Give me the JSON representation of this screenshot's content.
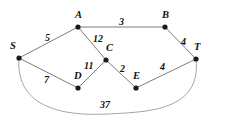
{
  "diagram": {
    "type": "weighted-undirected-graph",
    "nodes": [
      {
        "id": "S",
        "label": "S",
        "x": 19,
        "y": 58,
        "label_dx": -9,
        "label_dy": -17
      },
      {
        "id": "A",
        "label": "A",
        "x": 78,
        "y": 27,
        "label_dx": -3,
        "label_dy": -17
      },
      {
        "id": "B",
        "label": "B",
        "x": 165,
        "y": 27,
        "label_dx": -3,
        "label_dy": -17
      },
      {
        "id": "C",
        "label": "C",
        "x": 106,
        "y": 60,
        "label_dx": 0,
        "label_dy": -17
      },
      {
        "id": "D",
        "label": "D",
        "x": 78,
        "y": 88,
        "label_dx": -4,
        "label_dy": -17
      },
      {
        "id": "E",
        "label": "E",
        "x": 136,
        "y": 88,
        "label_dx": -3,
        "label_dy": -17
      },
      {
        "id": "T",
        "label": "T",
        "x": 196,
        "y": 59,
        "label_dx": -2,
        "label_dy": -17
      }
    ],
    "edges": [
      {
        "id": "SA",
        "from": "S",
        "to": "A",
        "weight": "5",
        "curved": false,
        "label_x": 45,
        "label_y": 33
      },
      {
        "id": "AB",
        "from": "A",
        "to": "B",
        "weight": "3",
        "curved": false,
        "label_x": 119,
        "label_y": 17
      },
      {
        "id": "BT",
        "from": "B",
        "to": "T",
        "weight": "4",
        "curved": false,
        "label_x": 181,
        "label_y": 37
      },
      {
        "id": "AC",
        "from": "A",
        "to": "C",
        "weight": "12",
        "curved": false,
        "label_x": 93,
        "label_y": 34
      },
      {
        "id": "CD",
        "from": "C",
        "to": "D",
        "weight": "11",
        "curved": false,
        "label_x": 84,
        "label_y": 61
      },
      {
        "id": "CE",
        "from": "C",
        "to": "E",
        "weight": "2",
        "curved": false,
        "label_x": 120,
        "label_y": 64
      },
      {
        "id": "ET",
        "from": "E",
        "to": "T",
        "weight": "4",
        "curved": false,
        "label_x": 160,
        "label_y": 62
      },
      {
        "id": "SD",
        "from": "S",
        "to": "D",
        "weight": "7",
        "curved": false,
        "label_x": 44,
        "label_y": 75
      },
      {
        "id": "ST",
        "from": "S",
        "to": "T",
        "weight": "37",
        "curved": true,
        "label_x": 100,
        "label_y": 100
      }
    ]
  },
  "credit": {
    "text": "© Cengage Learning 2014"
  },
  "colors": {
    "node": "#1a1a1a",
    "edge": "#6e6e6e",
    "curve": "#9a9a9a",
    "label": "#111111",
    "credit": "#8d8d8d",
    "background": "#ffffff"
  }
}
